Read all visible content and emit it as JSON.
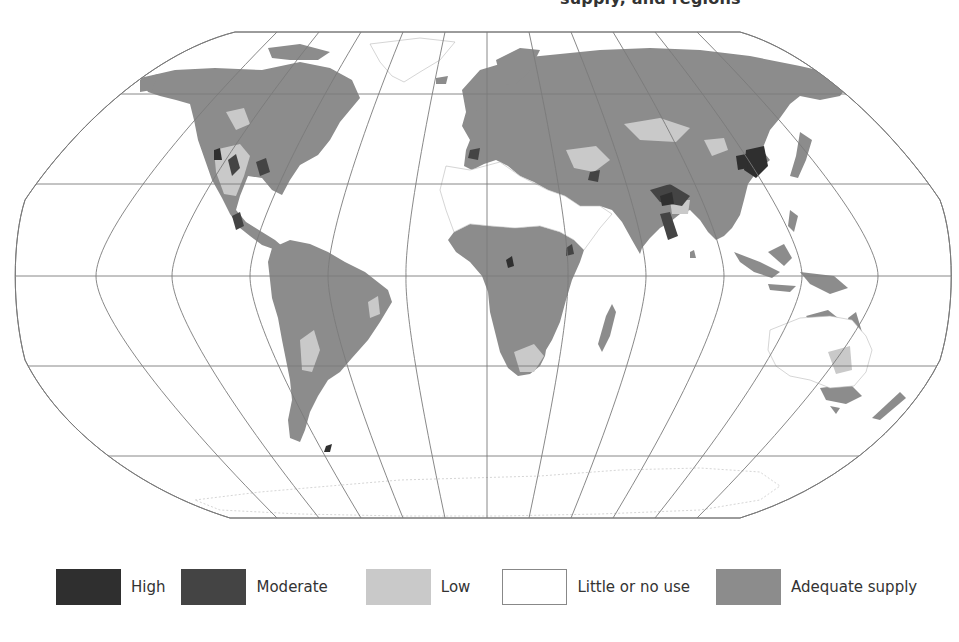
{
  "title": {
    "fragment": "supply, and regions"
  },
  "map": {
    "projection": "Robinson",
    "colors": {
      "high": "#2f2f2f",
      "moderate": "#444444",
      "low": "#c9c9c9",
      "little_or_no_use": "#ffffff",
      "adequate_supply": "#8c8c8c",
      "grid": "#7a7a7a",
      "borders": "#bdbdbd"
    }
  },
  "legend": {
    "items": [
      {
        "key": "high",
        "label": "High",
        "color": "#2f2f2f"
      },
      {
        "key": "moderate",
        "label": "Moderate",
        "color": "#444444"
      },
      {
        "key": "low",
        "label": "Low",
        "color": "#c9c9c9"
      },
      {
        "key": "little_or_no_use",
        "label": "Little or no use",
        "color": "#ffffff"
      },
      {
        "key": "adequate_supply",
        "label": "Adequate supply",
        "color": "#8c8c8c"
      }
    ]
  }
}
